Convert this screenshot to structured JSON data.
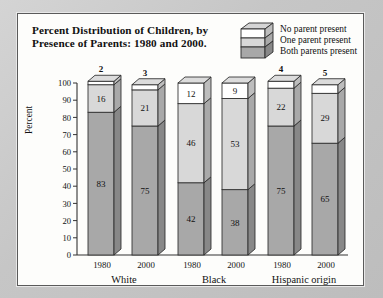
{
  "panel": {
    "title_line1": "Percent Distribution of Children, by",
    "title_line2": "Presence of Parents: 1980 and 2000."
  },
  "legend": {
    "icon_name": "stacked-box-legend-icon",
    "items": [
      {
        "label": "No parent present",
        "color": "#ffffff"
      },
      {
        "label": "One parent present",
        "color": "#d8d8d8"
      },
      {
        "label": "Both parents present",
        "color": "#a8a8a8"
      }
    ]
  },
  "axis": {
    "ylabel": "Percent",
    "yticks": [
      "100",
      "90",
      "80",
      "70",
      "60",
      "50",
      "40",
      "30",
      "20",
      "10",
      "0"
    ],
    "ymin": 0,
    "ymax": 100
  },
  "chart_data": {
    "type": "bar",
    "title": "Percent Distribution of Children, by Presence of Parents: 1980 and 2000.",
    "xlabel": "",
    "ylabel": "Percent",
    "ylim": [
      0,
      100
    ],
    "grid": false,
    "stacked": true,
    "legend_position": "top-right",
    "groups": [
      "White",
      "Black",
      "Hispanic origin"
    ],
    "categories": [
      "1980",
      "2000",
      "1980",
      "2000",
      "1980",
      "2000"
    ],
    "series": [
      {
        "name": "Both parents present",
        "color": "#a8a8a8",
        "values": [
          83,
          75,
          42,
          38,
          75,
          65
        ]
      },
      {
        "name": "One parent present",
        "color": "#d8d8d8",
        "values": [
          16,
          21,
          46,
          53,
          22,
          29
        ]
      },
      {
        "name": "No parent present",
        "color": "#ffffff",
        "values": [
          2,
          3,
          12,
          9,
          4,
          5
        ]
      }
    ],
    "bars": [
      {
        "group": "White",
        "year": "1980",
        "both": 83,
        "one": 16,
        "none": 2,
        "none_label_position": "above"
      },
      {
        "group": "White",
        "year": "2000",
        "both": 75,
        "one": 21,
        "none": 3,
        "none_label_position": "above"
      },
      {
        "group": "Black",
        "year": "1980",
        "both": 42,
        "one": 46,
        "none": 12,
        "none_label_position": "inside"
      },
      {
        "group": "Black",
        "year": "2000",
        "both": 38,
        "one": 53,
        "none": 9,
        "none_label_position": "inside"
      },
      {
        "group": "Hispanic origin",
        "year": "1980",
        "both": 75,
        "one": 22,
        "none": 4,
        "none_label_position": "above"
      },
      {
        "group": "Hispanic origin",
        "year": "2000",
        "both": 65,
        "one": 29,
        "none": 5,
        "none_label_position": "above"
      }
    ]
  }
}
